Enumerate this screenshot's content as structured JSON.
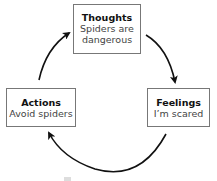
{
  "diagram": {
    "type": "cycle",
    "nodes": [
      {
        "id": "thoughts",
        "title": "Thoughts",
        "text": "Spiders are dangerous"
      },
      {
        "id": "feelings",
        "title": "Feelings",
        "text": "I'm scared"
      },
      {
        "id": "actions",
        "title": "Actions",
        "text": "Avoid spiders"
      }
    ],
    "edges": [
      {
        "from": "thoughts",
        "to": "feelings"
      },
      {
        "from": "feelings",
        "to": "actions"
      },
      {
        "from": "actions",
        "to": "thoughts"
      }
    ]
  },
  "thoughts": {
    "title": "Thoughts",
    "line1": "Spiders are",
    "line2": "dangerous"
  },
  "feelings": {
    "title": "Feelings",
    "line1": "I’m scared"
  },
  "actions": {
    "title": "Actions",
    "line1": "Avoid spiders"
  }
}
